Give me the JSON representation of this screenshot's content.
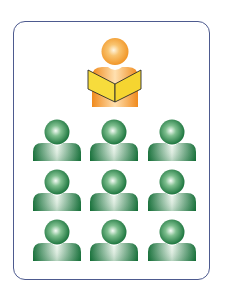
{
  "diagram": {
    "frame": {
      "border_color": "#4d5a8f",
      "background": "#ffffff"
    },
    "teacher": {
      "label": "teacher",
      "icon": "person-reading-book-icon",
      "colors": {
        "skin_light": "#fff3d6",
        "skin_mid": "#f7b04a",
        "skin_dark": "#f08a1c",
        "book_fill": "#f7dc3c",
        "book_outline": "#2b2b2b"
      }
    },
    "students": {
      "label": "students",
      "icon": "person-icon",
      "rows": 3,
      "columns": 3,
      "count": 9,
      "colors": {
        "light": "#f2f7f2",
        "mid": "#5fa873",
        "dark": "#0f6b33"
      }
    }
  }
}
